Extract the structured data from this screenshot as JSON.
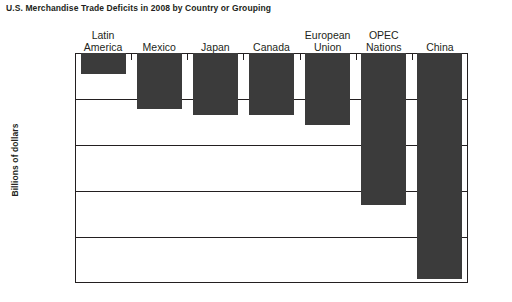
{
  "chart_data": {
    "type": "bar",
    "title": "U.S. Merchandise Trade Deficits in 2008 by Country or Grouping",
    "xlabel": "",
    "ylabel": "Billions of dollars",
    "categories": [
      "Latin America",
      "Mexico",
      "Japan",
      "Canada",
      "European Union",
      "OPEC Nations",
      "China"
    ],
    "category_lines": [
      [
        "Latin",
        "America"
      ],
      [
        "Mexico",
        ""
      ],
      [
        "Japan",
        ""
      ],
      [
        "Canada",
        ""
      ],
      [
        "European",
        "Union"
      ],
      [
        "OPEC",
        "Nations"
      ],
      [
        "China",
        ""
      ]
    ],
    "values": [
      -23,
      -61,
      -67,
      -67,
      -78,
      -165,
      -246
    ],
    "ylim": [
      -250,
      0
    ],
    "yticks": [
      0,
      -50,
      -100,
      -150,
      -200,
      -250
    ],
    "ytick_labels": [
      "0",
      "-50",
      "-100",
      "-150",
      "-200",
      "-250"
    ],
    "grid": true,
    "legend": "none",
    "bar_color": "#3b3b3b",
    "axis_color": "#231f20",
    "background": "#ffffff"
  }
}
